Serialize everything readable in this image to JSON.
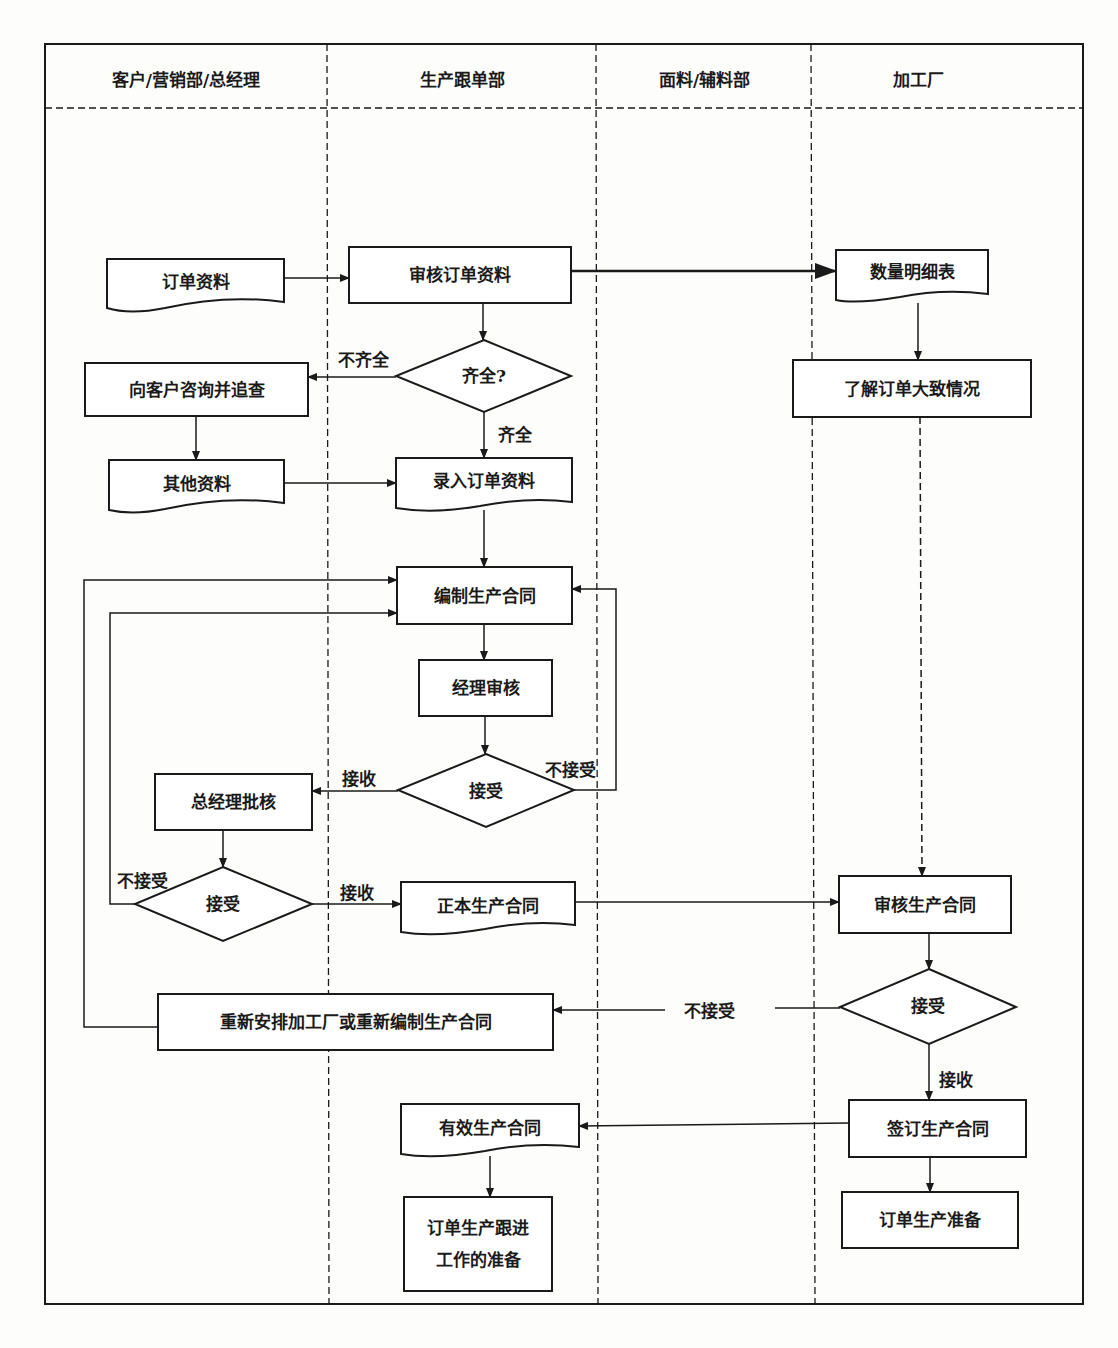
{
  "lanes": [
    {
      "title": "客户/营销部/总经理"
    },
    {
      "title": "生产跟单部"
    },
    {
      "title": "面料/辅料部"
    },
    {
      "title": "加工厂"
    }
  ],
  "nodes": {
    "order_data": "订单资料",
    "review_order_data": "审核订单资料",
    "quantity_detail_sheet": "数量明细表",
    "understand_order": "了解订单大致情况",
    "complete_check": "齐全?",
    "consult_customer": "向客户咨询并追查",
    "other_data": "其他资料",
    "enter_order_data": "录入订单资料",
    "draft_contract": "编制生产合同",
    "manager_review": "经理审核",
    "accept_check_1": "接受",
    "gm_approval": "总经理批核",
    "accept_check_2": "接受",
    "official_contract": "正本生产合同",
    "factory_review_contract": "审核生产合同",
    "accept_check_3": "接受",
    "rearrange": "重新安排加工厂或重新编制生产合同",
    "valid_contract": "有效生产合同",
    "sign_contract": "签订生产合同",
    "followup_prep": "订单生产跟进\n工作的准备",
    "production_prep": "订单生产准备"
  },
  "edge_labels": {
    "incomplete": "不齐全",
    "complete": "齐全",
    "accept_1": "接收",
    "reject_1": "不接受",
    "reject_2": "不接受",
    "accept_2": "接收",
    "reject_3": "不接受",
    "accept_3": "接收"
  },
  "colors": {
    "line": "#1a1a1a",
    "background": "#fdfdfc"
  }
}
